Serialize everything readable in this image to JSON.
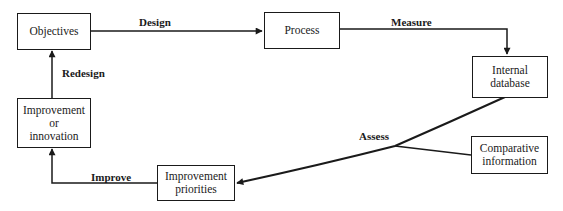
{
  "nodes": {
    "objectives": {
      "label": "Objectives"
    },
    "process": {
      "label": "Process"
    },
    "internal_database": {
      "line1": "Internal",
      "line2": "database"
    },
    "improvement_innovation": {
      "line1": "Improvement",
      "line2": "or",
      "line3": "innovation"
    },
    "improvement_priorities": {
      "line1": "Improvement",
      "line2": "priorities"
    },
    "comparative_information": {
      "line1": "Comparative",
      "line2": "information"
    }
  },
  "edges": {
    "design": "Design",
    "measure": "Measure",
    "assess": "Assess",
    "improve": "Improve",
    "redesign": "Redesign"
  },
  "colors": {
    "stroke": "#1a1a1a",
    "background": "#ffffff"
  }
}
